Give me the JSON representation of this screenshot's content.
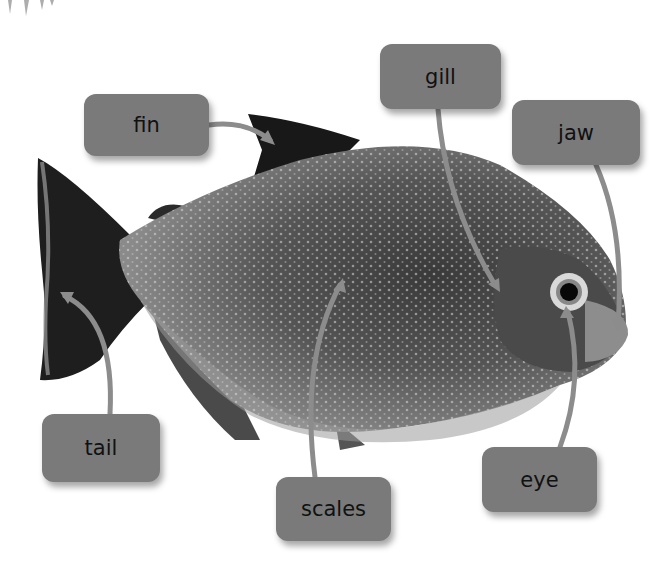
{
  "diagram": {
    "labels": [
      {
        "id": "fin",
        "text": "fin",
        "x": 84,
        "y": 94,
        "w": 125,
        "h": 62,
        "target": "dorsal fin"
      },
      {
        "id": "gill",
        "text": "gill",
        "x": 380,
        "y": 44,
        "w": 121,
        "h": 65,
        "target": "gill cover"
      },
      {
        "id": "jaw",
        "text": "jaw",
        "x": 512,
        "y": 100,
        "w": 128,
        "h": 65,
        "target": "lower jaw"
      },
      {
        "id": "tail",
        "text": "tail",
        "x": 42,
        "y": 414,
        "w": 118,
        "h": 68,
        "target": "tail fin"
      },
      {
        "id": "scales",
        "text": "scales",
        "x": 276,
        "y": 477,
        "w": 115,
        "h": 64,
        "target": "body scales"
      },
      {
        "id": "eye",
        "text": "eye",
        "x": 482,
        "y": 447,
        "w": 115,
        "h": 65,
        "target": "eye"
      }
    ],
    "colors": {
      "label_fill": "#7a7a7a",
      "leader_line": "#8c8c8c",
      "label_text": "#111111",
      "background": "#ffffff"
    }
  }
}
